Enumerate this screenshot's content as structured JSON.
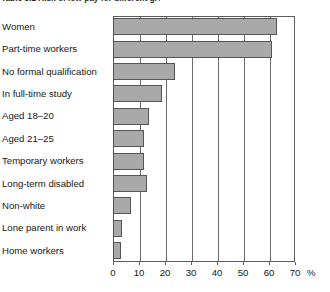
{
  "caption": {
    "text": "Table 3.1  Risk of low pay for different groups"
  },
  "chart_data": {
    "type": "bar",
    "orientation": "horizontal",
    "title": "",
    "xlabel": "%",
    "ylabel": "",
    "xlim": [
      0,
      70
    ],
    "xticks": [
      0,
      10,
      20,
      30,
      40,
      50,
      60,
      70
    ],
    "xtick_labels": [
      "0",
      "10",
      "20",
      "30",
      "40",
      "50",
      "60",
      "70"
    ],
    "grid": "vertical",
    "legend": "none",
    "bar_fill_color": "#a9a9a9",
    "bar_edge_color": "#555555",
    "axis_color": "#5d5d5d",
    "categories": [
      "Women",
      "Part-time workers",
      "No formal qualification",
      "In full-time study",
      "Aged 18–20",
      "Aged 21–25",
      "Temporary workers",
      "Long-term disabled",
      "Non-white",
      "Lone parent in work",
      "Home workers"
    ],
    "values": [
      63,
      61,
      24,
      19,
      14,
      12,
      12,
      13,
      7,
      3.5,
      3
    ]
  }
}
